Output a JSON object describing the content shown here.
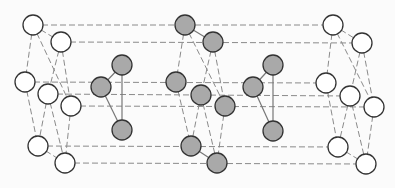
{
  "diagram": {
    "title": "",
    "colors": {
      "background": "#fbfbfb",
      "edge_dashed": "#8a8a8a",
      "edge_solid": "#777777",
      "node_stroke": "#333333",
      "node_fill_empty": "#ffffff",
      "node_fill_gray": "#a9a9a9"
    },
    "node_radius": 10,
    "nodes": [
      {
        "id": "L1",
        "x": 33,
        "y": 25,
        "fill": "empty"
      },
      {
        "id": "L2",
        "x": 61,
        "y": 42,
        "fill": "empty"
      },
      {
        "id": "L3",
        "x": 25,
        "y": 82,
        "fill": "empty"
      },
      {
        "id": "L4",
        "x": 48,
        "y": 94,
        "fill": "empty"
      },
      {
        "id": "L5",
        "x": 71,
        "y": 106,
        "fill": "empty"
      },
      {
        "id": "L6",
        "x": 38,
        "y": 146,
        "fill": "empty"
      },
      {
        "id": "L7",
        "x": 65,
        "y": 163,
        "fill": "empty"
      },
      {
        "id": "A1",
        "x": 122,
        "y": 65,
        "fill": "gray"
      },
      {
        "id": "A2",
        "x": 101,
        "y": 87,
        "fill": "gray"
      },
      {
        "id": "A3",
        "x": 122,
        "y": 130,
        "fill": "gray"
      },
      {
        "id": "M1",
        "x": 185,
        "y": 25,
        "fill": "gray"
      },
      {
        "id": "M2",
        "x": 213,
        "y": 42,
        "fill": "gray"
      },
      {
        "id": "M3",
        "x": 176,
        "y": 82,
        "fill": "gray"
      },
      {
        "id": "M4",
        "x": 201,
        "y": 95,
        "fill": "gray"
      },
      {
        "id": "M5",
        "x": 225,
        "y": 106,
        "fill": "gray"
      },
      {
        "id": "M6",
        "x": 191,
        "y": 146,
        "fill": "gray"
      },
      {
        "id": "M7",
        "x": 217,
        "y": 163,
        "fill": "gray"
      },
      {
        "id": "B1",
        "x": 273,
        "y": 65,
        "fill": "gray"
      },
      {
        "id": "B2",
        "x": 253,
        "y": 87,
        "fill": "gray"
      },
      {
        "id": "B3",
        "x": 273,
        "y": 131,
        "fill": "gray"
      },
      {
        "id": "R1",
        "x": 333,
        "y": 25,
        "fill": "empty"
      },
      {
        "id": "R2",
        "x": 362,
        "y": 43,
        "fill": "empty"
      },
      {
        "id": "R3",
        "x": 326,
        "y": 83,
        "fill": "empty"
      },
      {
        "id": "R4",
        "x": 350,
        "y": 96,
        "fill": "empty"
      },
      {
        "id": "R5",
        "x": 374,
        "y": 107,
        "fill": "empty"
      },
      {
        "id": "R6",
        "x": 338,
        "y": 147,
        "fill": "empty"
      },
      {
        "id": "R7",
        "x": 366,
        "y": 164,
        "fill": "empty"
      }
    ],
    "edges": [
      {
        "from": "L1",
        "to": "R1",
        "style": "dashed"
      },
      {
        "from": "L2",
        "to": "R2",
        "style": "dashed"
      },
      {
        "from": "L3",
        "to": "R3",
        "style": "dashed"
      },
      {
        "from": "L4",
        "to": "R4",
        "style": "dashed"
      },
      {
        "from": "L5",
        "to": "R5",
        "style": "dashed"
      },
      {
        "from": "L6",
        "to": "R6",
        "style": "dashed"
      },
      {
        "from": "L7",
        "to": "R7",
        "style": "dashed"
      },
      {
        "from": "L1",
        "to": "L2",
        "style": "dashed"
      },
      {
        "from": "L1",
        "to": "L3",
        "style": "dashed"
      },
      {
        "from": "L1",
        "to": "L5",
        "style": "dashed"
      },
      {
        "from": "L2",
        "to": "L4",
        "style": "dashed"
      },
      {
        "from": "L2",
        "to": "L5",
        "style": "dashed"
      },
      {
        "from": "L3",
        "to": "L6",
        "style": "dashed"
      },
      {
        "from": "L4",
        "to": "L6",
        "style": "dashed"
      },
      {
        "from": "L4",
        "to": "L7",
        "style": "dashed"
      },
      {
        "from": "L5",
        "to": "L7",
        "style": "dashed"
      },
      {
        "from": "L6",
        "to": "L7",
        "style": "dashed"
      },
      {
        "from": "M1",
        "to": "M2",
        "style": "solid"
      },
      {
        "from": "M1",
        "to": "M3",
        "style": "dashed"
      },
      {
        "from": "M1",
        "to": "M5",
        "style": "dashed"
      },
      {
        "from": "M2",
        "to": "M4",
        "style": "dashed"
      },
      {
        "from": "M2",
        "to": "M5",
        "style": "dashed"
      },
      {
        "from": "M3",
        "to": "M6",
        "style": "dashed"
      },
      {
        "from": "M4",
        "to": "M6",
        "style": "dashed"
      },
      {
        "from": "M4",
        "to": "M7",
        "style": "dashed"
      },
      {
        "from": "M5",
        "to": "M7",
        "style": "dashed"
      },
      {
        "from": "M6",
        "to": "M7",
        "style": "solid"
      },
      {
        "from": "R1",
        "to": "R2",
        "style": "dashed"
      },
      {
        "from": "R1",
        "to": "R3",
        "style": "dashed"
      },
      {
        "from": "R1",
        "to": "R5",
        "style": "dashed"
      },
      {
        "from": "R2",
        "to": "R4",
        "style": "dashed"
      },
      {
        "from": "R2",
        "to": "R5",
        "style": "dashed"
      },
      {
        "from": "R3",
        "to": "R6",
        "style": "dashed"
      },
      {
        "from": "R4",
        "to": "R6",
        "style": "dashed"
      },
      {
        "from": "R4",
        "to": "R7",
        "style": "dashed"
      },
      {
        "from": "R5",
        "to": "R7",
        "style": "dashed"
      },
      {
        "from": "R6",
        "to": "R7",
        "style": "dashed"
      },
      {
        "from": "A1",
        "to": "A2",
        "style": "solid"
      },
      {
        "from": "A1",
        "to": "A3",
        "style": "solid"
      },
      {
        "from": "A2",
        "to": "A3",
        "style": "solid"
      },
      {
        "from": "B1",
        "to": "B2",
        "style": "solid"
      },
      {
        "from": "B1",
        "to": "B3",
        "style": "solid"
      },
      {
        "from": "B2",
        "to": "B3",
        "style": "solid"
      }
    ]
  }
}
